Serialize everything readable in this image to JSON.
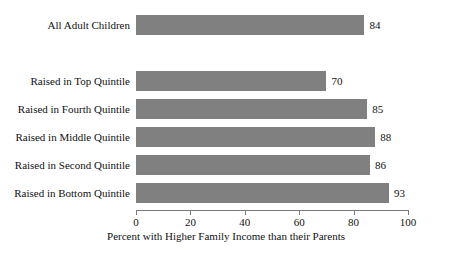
{
  "chart_data": {
    "type": "bar",
    "orientation": "horizontal",
    "title": "",
    "xlabel": "Percent with Higher Family Income than their Parents",
    "ylabel": "",
    "xlim": [
      0,
      100
    ],
    "xticks": [
      0,
      20,
      40,
      60,
      80,
      100
    ],
    "xtick_labels": [
      "0",
      "20",
      "40",
      "60",
      "80",
      "100"
    ],
    "grid": false,
    "legend": null,
    "bar_color": "#808080",
    "axis_color": "#7a7a7a",
    "categories": [
      "All Adult Children",
      "Raised in Top Quintile",
      "Raised in Fourth Quintile",
      "Raised in Middle Quintile",
      "Raised in Second Quintile",
      "Raised in Bottom Quintile"
    ],
    "values": [
      84,
      70,
      85,
      88,
      86,
      93
    ],
    "value_labels": [
      "84",
      "70",
      "85",
      "88",
      "86",
      "93"
    ],
    "bars": [
      {
        "label": "All Adult Children",
        "value": 84,
        "value_label": "84",
        "top": 15,
        "group": "total"
      },
      {
        "label": "Raised in Top Quintile",
        "value": 70,
        "value_label": "70",
        "top": 71,
        "group": "quintile"
      },
      {
        "label": "Raised in Fourth Quintile",
        "value": 85,
        "value_label": "85",
        "top": 99,
        "group": "quintile"
      },
      {
        "label": "Raised in Middle Quintile",
        "value": 88,
        "value_label": "88",
        "top": 127,
        "group": "quintile"
      },
      {
        "label": "Raised in Second Quintile",
        "value": 86,
        "value_label": "86",
        "top": 155,
        "group": "quintile"
      },
      {
        "label": "Raised in Bottom Quintile",
        "value": 93,
        "value_label": "93",
        "top": 183,
        "group": "quintile"
      }
    ]
  }
}
